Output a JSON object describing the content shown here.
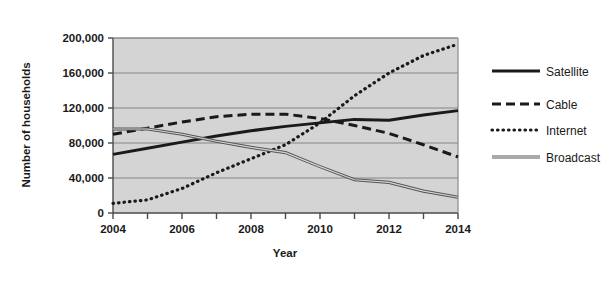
{
  "chart_data": {
    "type": "line",
    "title": "",
    "xlabel": "Year",
    "ylabel": "Number of households",
    "x": [
      2004,
      2005,
      2006,
      2007,
      2008,
      2009,
      2010,
      2011,
      2012,
      2013,
      2014
    ],
    "xlim": [
      2004,
      2014
    ],
    "ylim": [
      0,
      200000
    ],
    "xtick_labels": [
      "2004",
      "2006",
      "2008",
      "2010",
      "2012",
      "2014"
    ],
    "xtick_values": [
      2004,
      2006,
      2008,
      2010,
      2012,
      2014
    ],
    "ytick_labels": [
      "0",
      "40,000",
      "80,000",
      "120,000",
      "160,000",
      "200,000"
    ],
    "ytick_values": [
      0,
      40000,
      80000,
      120000,
      160000,
      200000
    ],
    "grid": true,
    "grid_axis": "y",
    "legend_position": "right",
    "plot_background": "#d4d4d4",
    "series": [
      {
        "name": "Satellite",
        "style": "solid-thick",
        "color": "#1a1a1a",
        "values": [
          67000,
          74000,
          81000,
          88000,
          94000,
          99000,
          103000,
          107000,
          106000,
          112000,
          117000
        ]
      },
      {
        "name": "Cable",
        "style": "dashed",
        "color": "#1a1a1a",
        "values": [
          90000,
          97000,
          104000,
          110000,
          113000,
          113000,
          108000,
          100000,
          91000,
          78000,
          64000
        ]
      },
      {
        "name": "Internet",
        "style": "dotted",
        "color": "#1a1a1a",
        "values": [
          11000,
          15000,
          28000,
          46000,
          62000,
          78000,
          103000,
          134000,
          160000,
          180000,
          193000
        ]
      },
      {
        "name": "Broadcast",
        "style": "double-thin",
        "color": "#555555",
        "values": [
          96000,
          96000,
          90000,
          82000,
          75000,
          69000,
          53000,
          38000,
          35000,
          25000,
          18000
        ]
      }
    ]
  },
  "legend": {
    "items": [
      {
        "label": "Satellite"
      },
      {
        "label": "Cable"
      },
      {
        "label": "Internet"
      },
      {
        "label": "Broadcast"
      }
    ]
  }
}
